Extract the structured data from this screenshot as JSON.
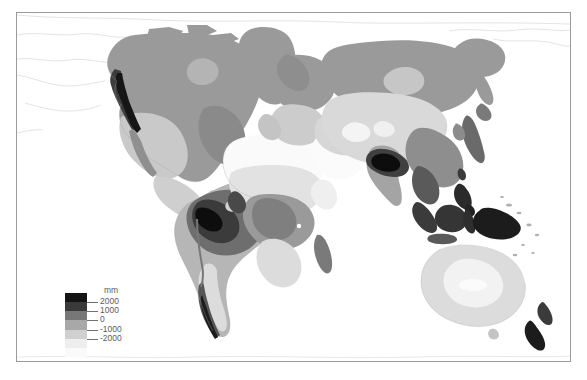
{
  "figure": {
    "type": "world-map-choropleth",
    "background": "#ffffff",
    "width": 587,
    "height": 380,
    "frame": {
      "x": 16,
      "y": 12,
      "width": 555,
      "height": 350,
      "border_color": "#9a9a9a"
    },
    "caption": "",
    "ocean_color": "#ffffff",
    "coastline_color": "#b8b8b8"
  },
  "legend": {
    "unit_label": "mm",
    "orientation": "vertical",
    "tick_labels": [
      "2000",
      "1000",
      "0",
      "-1000",
      "-2000"
    ],
    "tick_values": [
      2000,
      1000,
      0,
      -1000,
      -2000
    ],
    "band_colors": [
      "#141414",
      "#3a3a3a",
      "#777777",
      "#a8a8a8",
      "#d0d0d0",
      "#eeeeee",
      "#fafafa"
    ],
    "band_count": 7,
    "label_color": "#5c5c5c",
    "tick_color": "#6f6f6f"
  },
  "chart_data": {
    "type": "heatmap",
    "title": "",
    "subtitle": "",
    "xlabel": "",
    "ylabel": "",
    "projection": "equirectangular",
    "variable": "Precipitation minus evaporation (P - E)",
    "unit": "mm",
    "colormap": "grayscale (dark = high, light = low)",
    "legend_position": "bottom-left inside frame",
    "grid": false,
    "value_range": [
      -2000,
      2000
    ],
    "class_breaks": [
      -2000,
      -1000,
      0,
      1000,
      2000
    ],
    "class_labels": [
      "below -2000",
      "-2000 to -1000",
      "-1000 to 0",
      "0 to 1000",
      "1000 to 2000",
      "above 2000"
    ],
    "class_colors": [
      "#fafafa",
      "#eeeeee",
      "#d0d0d0",
      "#a8a8a8",
      "#777777",
      "#3a3a3a",
      "#141414"
    ],
    "regions": [
      {
        "name": "Greenland",
        "class": "0 to 1000",
        "color": "#9a9a9a"
      },
      {
        "name": "Canadian Arctic",
        "class": "0 to 1000",
        "color": "#9a9a9a"
      },
      {
        "name": "Alaska / Pacific Northwest coast",
        "class": "above 2000",
        "color": "#1a1a1a"
      },
      {
        "name": "Western United States interior",
        "class": "-1000 to 0",
        "color": "#c8c8c8"
      },
      {
        "name": "Eastern North America",
        "class": "0 to 1000",
        "color": "#9a9a9a"
      },
      {
        "name": "Mexico / Central America",
        "class": "-1000 to 0",
        "color": "#c8c8c8"
      },
      {
        "name": "Amazon Basin",
        "class": "above 2000",
        "color": "#2a2a2a"
      },
      {
        "name": "Northwest South America (Colombia)",
        "class": "above 2000",
        "color": "#141414"
      },
      {
        "name": "Southern South America",
        "class": "-1000 to 0",
        "color": "#c8c8c8"
      },
      {
        "name": "Patagonia / Chile coast",
        "class": "1000 to 2000",
        "color": "#707070"
      },
      {
        "name": "Sahara Desert",
        "class": "below -2000",
        "color": "#fafafa"
      },
      {
        "name": "Arabian Peninsula",
        "class": "below -2000",
        "color": "#fafafa"
      },
      {
        "name": "Central Africa (Congo)",
        "class": "0 to 1000",
        "color": "#9a9a9a"
      },
      {
        "name": "Southern Africa",
        "class": "-1000 to 0",
        "color": "#d6d6d6"
      },
      {
        "name": "Madagascar",
        "class": "0 to 1000",
        "color": "#8a8a8a"
      },
      {
        "name": "Europe",
        "class": "0 to 1000",
        "color": "#9a9a9a"
      },
      {
        "name": "Siberia",
        "class": "0 to 1000",
        "color": "#9a9a9a"
      },
      {
        "name": "Central Asia",
        "class": "-1000 to 0",
        "color": "#cfcfcf"
      },
      {
        "name": "Tibetan Plateau / Himalaya front",
        "class": "above 2000",
        "color": "#1e1e1e"
      },
      {
        "name": "India / Southeast Asia",
        "class": "1000 to 2000",
        "color": "#7a7a7a"
      },
      {
        "name": "Japan / Korea",
        "class": "0 to 1000",
        "color": "#8a8a8a"
      },
      {
        "name": "Indonesia / Maritime Continent",
        "class": "above 2000",
        "color": "#242424"
      },
      {
        "name": "New Guinea",
        "class": "above 2000",
        "color": "#1e1e1e"
      },
      {
        "name": "Australia interior",
        "class": "below -2000",
        "color": "#f0f0f0"
      },
      {
        "name": "New Zealand",
        "class": "above 2000",
        "color": "#2a2a2a"
      }
    ]
  }
}
